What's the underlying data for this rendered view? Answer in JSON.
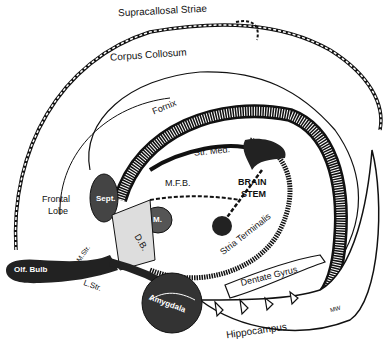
{
  "figure": {
    "type": "anatomical line drawing",
    "ink_color": "#111111",
    "background": "#ffffff"
  },
  "labels": {
    "supracallosal_striae": "Supracallosal Striae",
    "corpus_callosum": "Corpus Collosum",
    "fornix": "Fornix",
    "str_med": "Str. Med.",
    "mfb": "M.F.B.",
    "brain_stem_1": "BRAIN",
    "brain_stem_2": "STEM",
    "frontal_lobe_1": "Frontal",
    "frontal_lobe_2": "Lobe",
    "sept": "Sept.",
    "m": "M.",
    "hab": "H.",
    "db": "D.B.",
    "m_str": "M.Str.",
    "l_str": "L.Str.",
    "olf_bulb": "Olf. Bulb",
    "tub": "Tub.",
    "stria_terminalis": "Stria Terminalis",
    "dentate_gyrus": "Dentate Gyrus",
    "amygdala": "Amygdala",
    "hippocampus": "Hippocampus",
    "signature": "MW"
  }
}
